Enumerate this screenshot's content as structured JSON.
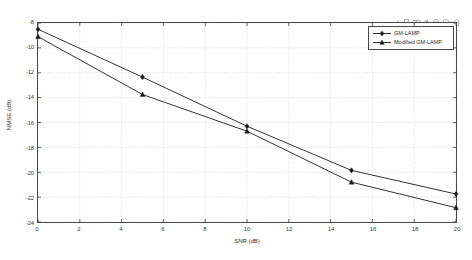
{
  "window": {
    "background_color": "#ffffff",
    "axes_color": "#3a3a3a",
    "grid_color": "#c8c8c8"
  },
  "toolbar": {
    "icons": [
      {
        "name": "brush-data-icon",
        "label": "Brush/Select Data"
      },
      {
        "name": "data-cursor-icon",
        "label": "Data Cursor"
      },
      {
        "name": "link-plot-icon",
        "label": "Link Plot"
      },
      {
        "name": "pan-icon",
        "label": "Pan"
      },
      {
        "name": "zoom-in-icon",
        "label": "Zoom In"
      },
      {
        "name": "zoom-out-icon",
        "label": "Zoom Out"
      },
      {
        "name": "restore-view-icon",
        "label": "Restore View"
      }
    ]
  },
  "legend": {
    "position": "upper-right",
    "entries": [
      {
        "label": "GM-LAMP",
        "marker": "diamond",
        "color": "#1a1a1a"
      },
      {
        "label": "Modified GM-LAMP",
        "marker": "triangle",
        "color": "#1a1a1a"
      }
    ]
  },
  "chart_data": {
    "type": "line",
    "title": "",
    "xlabel": "SNR (dB)",
    "ylabel": "NMSE (dB)",
    "xlim": [
      0,
      20
    ],
    "ylim": [
      -24,
      -8
    ],
    "xticks": [
      0,
      2,
      4,
      6,
      8,
      10,
      12,
      14,
      16,
      18,
      20
    ],
    "yticks": [
      -8,
      -10,
      -12,
      -14,
      -16,
      -18,
      -20,
      -22,
      -24
    ],
    "xtick_labels": [
      "0",
      "2",
      "4",
      "6",
      "8",
      "10",
      "12",
      "14",
      "16",
      "18",
      "20"
    ],
    "ytick_labels": [
      "-8",
      "-10",
      "-12",
      "-14",
      "-16",
      "-18",
      "-20",
      "-22",
      "-24"
    ],
    "grid": true,
    "legend_position": "upper right",
    "x": [
      0,
      5,
      10,
      15,
      20
    ],
    "series": [
      {
        "name": "GM-LAMP",
        "marker": "diamond",
        "color": "#1a1a1a",
        "values": [
          -8.5,
          -12.35,
          -16.3,
          -19.85,
          -21.75
        ]
      },
      {
        "name": "Modified GM-LAMP",
        "marker": "triangle",
        "color": "#1a1a1a",
        "values": [
          -9.1,
          -13.75,
          -16.7,
          -20.8,
          -22.85
        ]
      }
    ]
  }
}
